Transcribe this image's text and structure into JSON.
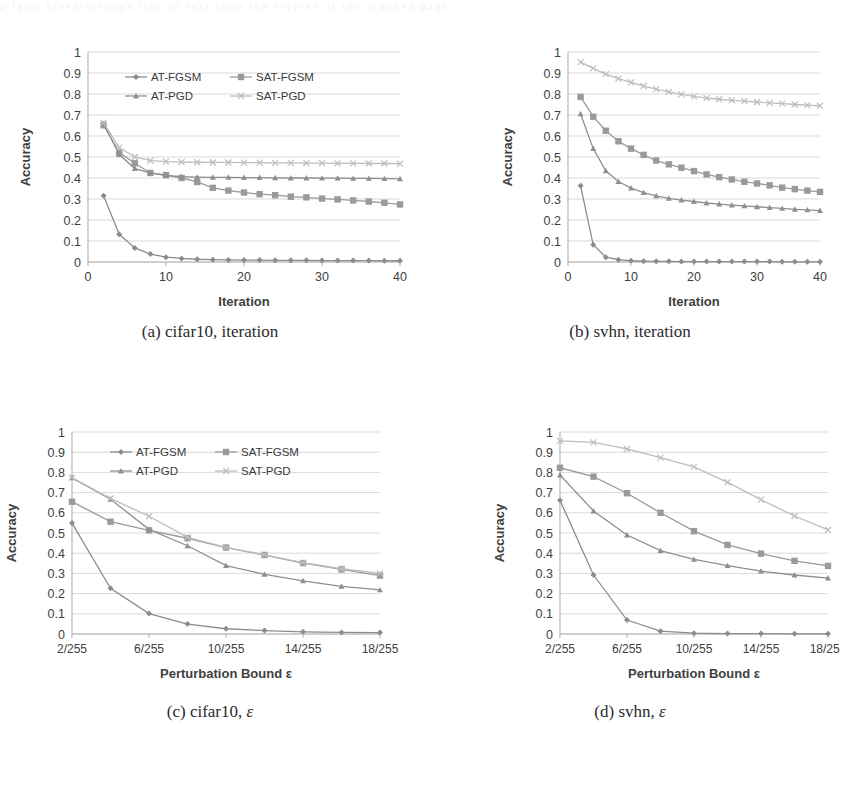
{
  "page": {
    "bleed_text": "a faint bleed-through line of text from the reverse of the scanned page"
  },
  "series_style": {
    "AT-FGSM": {
      "color": "#8c8c8c",
      "marker": "diamond"
    },
    "SAT-FGSM": {
      "color": "#9a9a9a",
      "marker": "square"
    },
    "AT-PGD": {
      "color": "#8f8f8f",
      "marker": "triangle"
    },
    "SAT-PGD": {
      "color": "#bdbdbd",
      "marker": "cross"
    }
  },
  "legend": {
    "items": [
      "AT-FGSM",
      "SAT-FGSM",
      "AT-PGD",
      "SAT-PGD"
    ]
  },
  "panels": [
    {
      "id": "a",
      "caption_prefix": "(a)",
      "caption_text": "cifar10, iteration",
      "caption_eps": ""
    },
    {
      "id": "b",
      "caption_prefix": "(b)",
      "caption_text": "svhn, iteration",
      "caption_eps": ""
    },
    {
      "id": "c",
      "caption_prefix": "(c)",
      "caption_text": "cifar10,",
      "caption_eps": "ε"
    },
    {
      "id": "d",
      "caption_prefix": "(d)",
      "caption_text": "svhn,",
      "caption_eps": "ε"
    }
  ],
  "chart_data": [
    {
      "id": "a",
      "type": "line",
      "title": "(a) cifar10, iteration",
      "xlabel": "Iteration",
      "ylabel": "Accuracy",
      "xlim": [
        0,
        40
      ],
      "ylim": [
        0,
        1
      ],
      "xticks": [
        0,
        10,
        20,
        30,
        40
      ],
      "xticklabels": [
        "0",
        "10",
        "20",
        "30",
        "40"
      ],
      "yticks": [
        0,
        0.1,
        0.2,
        0.3,
        0.4,
        0.5,
        0.6,
        0.7,
        0.8,
        0.9,
        1
      ],
      "yticklabels": [
        "0",
        "0.1",
        "0.2",
        "0.3",
        "0.4",
        "0.5",
        "0.6",
        "0.7",
        "0.8",
        "0.9",
        "1"
      ],
      "grid": true,
      "legend_position": "upper-center",
      "x": [
        2,
        4,
        6,
        8,
        10,
        12,
        14,
        16,
        18,
        20,
        22,
        24,
        26,
        28,
        30,
        32,
        34,
        36,
        38,
        40
      ],
      "series": [
        {
          "name": "AT-FGSM",
          "values": [
            0.315,
            0.132,
            0.067,
            0.038,
            0.023,
            0.017,
            0.013,
            0.011,
            0.01,
            0.009,
            0.009,
            0.008,
            0.008,
            0.008,
            0.007,
            0.007,
            0.007,
            0.007,
            0.006,
            0.006
          ]
        },
        {
          "name": "SAT-FGSM",
          "values": [
            0.651,
            0.521,
            0.47,
            0.424,
            0.414,
            0.4,
            0.381,
            0.353,
            0.34,
            0.331,
            0.323,
            0.318,
            0.311,
            0.308,
            0.302,
            0.298,
            0.293,
            0.288,
            0.282,
            0.274
          ]
        },
        {
          "name": "AT-PGD",
          "values": [
            0.66,
            0.512,
            0.445,
            0.424,
            0.412,
            0.406,
            0.404,
            0.403,
            0.403,
            0.402,
            0.402,
            0.401,
            0.4,
            0.4,
            0.399,
            0.399,
            0.398,
            0.398,
            0.397,
            0.396
          ]
        },
        {
          "name": "SAT-PGD",
          "values": [
            0.663,
            0.545,
            0.5,
            0.483,
            0.478,
            0.476,
            0.475,
            0.474,
            0.474,
            0.473,
            0.473,
            0.472,
            0.472,
            0.471,
            0.471,
            0.47,
            0.47,
            0.469,
            0.469,
            0.468
          ]
        }
      ]
    },
    {
      "id": "b",
      "type": "line",
      "title": "(b) svhn, iteration",
      "xlabel": "Iteration",
      "ylabel": "Accuracy",
      "xlim": [
        0,
        40
      ],
      "ylim": [
        0,
        1
      ],
      "xticks": [
        0,
        10,
        20,
        30,
        40
      ],
      "xticklabels": [
        "0",
        "10",
        "20",
        "30",
        "40"
      ],
      "yticks": [
        0,
        0.1,
        0.2,
        0.3,
        0.4,
        0.5,
        0.6,
        0.7,
        0.8,
        0.9,
        1
      ],
      "yticklabels": [
        "0",
        "0.1",
        "0.2",
        "0.3",
        "0.4",
        "0.5",
        "0.6",
        "0.7",
        "0.8",
        "0.9",
        "1"
      ],
      "grid": true,
      "legend_position": "none",
      "x": [
        2,
        4,
        6,
        8,
        10,
        12,
        14,
        16,
        18,
        20,
        22,
        24,
        26,
        28,
        30,
        32,
        34,
        36,
        38,
        40
      ],
      "series": [
        {
          "name": "AT-FGSM",
          "values": [
            0.363,
            0.082,
            0.023,
            0.011,
            0.006,
            0.004,
            0.003,
            0.003,
            0.002,
            0.002,
            0.002,
            0.002,
            0.002,
            0.002,
            0.002,
            0.002,
            0.001,
            0.001,
            0.001,
            0.001
          ]
        },
        {
          "name": "SAT-FGSM",
          "values": [
            0.786,
            0.692,
            0.625,
            0.575,
            0.54,
            0.51,
            0.483,
            0.465,
            0.449,
            0.433,
            0.417,
            0.404,
            0.393,
            0.382,
            0.374,
            0.365,
            0.354,
            0.347,
            0.34,
            0.334
          ]
        },
        {
          "name": "AT-PGD",
          "values": [
            0.705,
            0.54,
            0.434,
            0.383,
            0.352,
            0.33,
            0.315,
            0.303,
            0.295,
            0.288,
            0.281,
            0.276,
            0.271,
            0.267,
            0.263,
            0.259,
            0.255,
            0.251,
            0.248,
            0.245
          ]
        },
        {
          "name": "SAT-PGD",
          "values": [
            0.952,
            0.922,
            0.895,
            0.873,
            0.855,
            0.838,
            0.823,
            0.81,
            0.798,
            0.789,
            0.78,
            0.775,
            0.77,
            0.766,
            0.762,
            0.758,
            0.754,
            0.75,
            0.747,
            0.744
          ]
        }
      ]
    },
    {
      "id": "c",
      "type": "line",
      "title": "(c) cifar10, ε",
      "xlabel": "Perturbation Bound ε",
      "ylabel": "Accuracy",
      "xlim": [
        2,
        18
      ],
      "ylim": [
        0,
        1
      ],
      "xticks": [
        2,
        6,
        10,
        14,
        18
      ],
      "xticklabels": [
        "2/255",
        "6/255",
        "10/255",
        "14/255",
        "18/255"
      ],
      "yticks": [
        0,
        0.1,
        0.2,
        0.3,
        0.4,
        0.5,
        0.6,
        0.7,
        0.8,
        0.9,
        1
      ],
      "yticklabels": [
        "0",
        "0.1",
        "0.2",
        "0.3",
        "0.4",
        "0.5",
        "0.6",
        "0.7",
        "0.8",
        "0.9",
        "1"
      ],
      "grid": true,
      "legend_position": "upper-center",
      "x": [
        2,
        4,
        6,
        8,
        10,
        12,
        14,
        16,
        18
      ],
      "series": [
        {
          "name": "AT-FGSM",
          "values": [
            0.549,
            0.226,
            0.101,
            0.049,
            0.026,
            0.017,
            0.011,
            0.008,
            0.007
          ]
        },
        {
          "name": "SAT-FGSM",
          "values": [
            0.655,
            0.556,
            0.513,
            0.474,
            0.428,
            0.391,
            0.351,
            0.32,
            0.289
          ]
        },
        {
          "name": "AT-PGD",
          "values": [
            0.773,
            0.667,
            0.518,
            0.437,
            0.339,
            0.295,
            0.263,
            0.236,
            0.218
          ]
        },
        {
          "name": "SAT-PGD",
          "values": [
            0.774,
            0.671,
            0.583,
            0.478,
            0.429,
            0.392,
            0.353,
            0.323,
            0.3
          ]
        }
      ]
    },
    {
      "id": "d",
      "type": "line",
      "title": "(d) svhn, ε",
      "xlabel": "Perturbation Bound ε",
      "ylabel": "Accuracy",
      "xlim": [
        2,
        18
      ],
      "ylim": [
        0,
        1
      ],
      "xticks": [
        2,
        6,
        10,
        14,
        18
      ],
      "xticklabels": [
        "2/255",
        "6/255",
        "10/255",
        "14/255",
        "18/255"
      ],
      "yticks": [
        0,
        0.1,
        0.2,
        0.3,
        0.4,
        0.5,
        0.6,
        0.7,
        0.8,
        0.9,
        1
      ],
      "yticklabels": [
        "0",
        "0.1",
        "0.2",
        "0.3",
        "0.4",
        "0.5",
        "0.6",
        "0.7",
        "0.8",
        "0.9",
        "1"
      ],
      "grid": true,
      "legend_position": "none",
      "x": [
        2,
        4,
        6,
        8,
        10,
        12,
        14,
        16,
        18
      ],
      "series": [
        {
          "name": "AT-FGSM",
          "values": [
            0.662,
            0.292,
            0.069,
            0.014,
            0.004,
            0.002,
            0.002,
            0.001,
            0.001
          ]
        },
        {
          "name": "SAT-FGSM",
          "values": [
            0.823,
            0.779,
            0.697,
            0.6,
            0.509,
            0.441,
            0.398,
            0.362,
            0.337
          ]
        },
        {
          "name": "AT-PGD",
          "values": [
            0.787,
            0.609,
            0.49,
            0.413,
            0.369,
            0.338,
            0.311,
            0.292,
            0.277
          ]
        },
        {
          "name": "SAT-PGD",
          "values": [
            0.956,
            0.949,
            0.916,
            0.873,
            0.827,
            0.751,
            0.665,
            0.584,
            0.515
          ]
        }
      ]
    }
  ]
}
